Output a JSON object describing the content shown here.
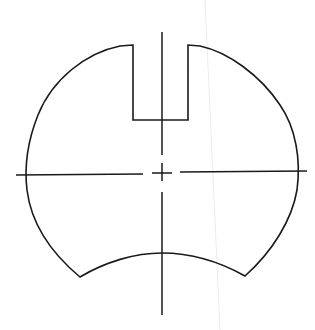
{
  "drawing": {
    "type": "technical-part-outline",
    "description": "Disc part with rectangular top slot, concave bottom edge and dashed center lines",
    "stroke_color": "#1a1a1a",
    "background": "#ffffff",
    "slot": {
      "left": 133,
      "right": 188,
      "top": 45,
      "bottom": 120
    },
    "center": {
      "x": 162,
      "y": 173
    },
    "vertical_centerline": {
      "x": 162,
      "y_start": 32,
      "y_end": 315,
      "gaps": [
        [
          155,
          163
        ],
        [
          181,
          192
        ]
      ]
    },
    "horizontal_centerline": {
      "y": 173,
      "x_start": 16,
      "x_end": 307,
      "gaps": [
        [
          143,
          152
        ],
        [
          172,
          180
        ]
      ]
    },
    "bottom_concave_edge": {
      "left": [
        80,
        277
      ],
      "apex": [
        162,
        253
      ],
      "right": [
        245,
        276
      ]
    }
  }
}
